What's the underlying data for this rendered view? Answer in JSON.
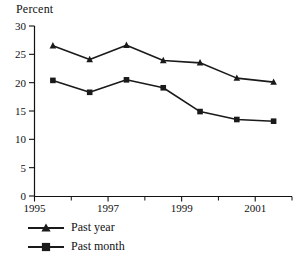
{
  "chart_data": {
    "type": "line",
    "title": "",
    "ylabel": "Percent",
    "xlabel": "",
    "ylim": [
      0,
      30
    ],
    "xlim": [
      1995,
      2002
    ],
    "yticks": [
      "0",
      "5",
      "10",
      "15",
      "20",
      "25",
      "30"
    ],
    "ytick_values": [
      0,
      5,
      10,
      15,
      20,
      25,
      30
    ],
    "xticks_major": [
      "1995",
      "1997",
      "1999",
      "2001"
    ],
    "xtick_major_values": [
      1995,
      1997,
      1999,
      2001
    ],
    "xtick_minor_values": [
      1996,
      1998,
      2000,
      2002
    ],
    "grid": false,
    "legend_position": "below-left",
    "x": [
      1995.5,
      1996.5,
      1997.5,
      1998.5,
      1999.5,
      2000.5,
      2001.5
    ],
    "series": [
      {
        "name": "Past year",
        "marker": "triangle",
        "color": "#1a1a1a",
        "x": [
          1995.5,
          1996.5,
          1997.5,
          1998.5,
          1999.5,
          2000.5,
          2001.5
        ],
        "values": [
          26.5,
          24.1,
          26.6,
          23.9,
          23.5,
          20.8,
          20.1
        ]
      },
      {
        "name": "Past month",
        "marker": "square",
        "color": "#1a1a1a",
        "x": [
          1995.5,
          1996.5,
          1997.5,
          1998.5,
          1999.5,
          2000.5,
          2001.5
        ],
        "values": [
          20.4,
          18.3,
          20.5,
          19.1,
          14.9,
          13.5,
          13.2
        ]
      }
    ]
  },
  "axis": {
    "y_title": "Percent"
  },
  "legend": {
    "items": [
      {
        "label": "Past year",
        "marker": "triangle-marker"
      },
      {
        "label": "Past month",
        "marker": "square-marker"
      }
    ]
  }
}
